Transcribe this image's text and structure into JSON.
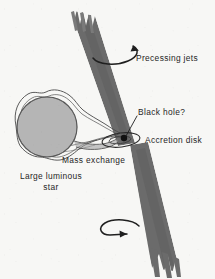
{
  "figure": {
    "background_color": "#f7f7f5",
    "ink_color": "#262626",
    "jet_color": "#6b6b6b",
    "star_fill_color": "#b5b5b5",
    "star_outline_color": "#4a4a4a",
    "black_hole_color": "#111111"
  },
  "labels": {
    "precessing_jets": "Precessing jets",
    "black_hole": "Black hole?",
    "accretion_disk": "Accretion disk",
    "mass_exchange": "Mass exchange",
    "large_luminous_star_line1": "Large luminous",
    "large_luminous_star_line2": "star"
  },
  "elements": {
    "upper_jet": "upper-precessing-jet",
    "lower_jet": "lower-precessing-jet",
    "upper_precession_arrow": "counter-clockwise-precession-arrow",
    "lower_precession_arrow": "clockwise-precession-arrow",
    "star": "large-luminous-star",
    "roche_lobe": "roche-lobe-envelope",
    "mass_stream": "mass-transfer-stream",
    "accretion_disk_ellipse": "accretion-disk-ellipse",
    "black_hole_dot": "black-hole-point",
    "black_hole_leader": "black-hole-leader-line"
  }
}
